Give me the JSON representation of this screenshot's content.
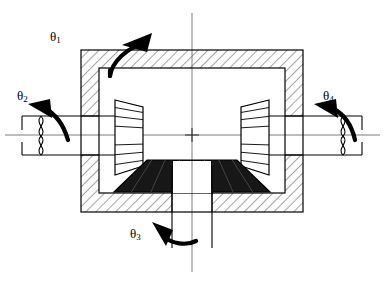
{
  "figure": {
    "type": "engineering-cross-section-diagram",
    "background_color": "#ffffff",
    "line_color": "#000000",
    "hatch_color": "#555555",
    "centerline_color": "#777777",
    "gear_fill_dark": "#171717"
  },
  "labels": {
    "theta1": {
      "symbol": "θ",
      "subscript": "1",
      "name": "housing-rotation"
    },
    "theta2": {
      "symbol": "θ",
      "subscript": "2",
      "name": "left-shaft-rotation"
    },
    "theta3": {
      "symbol": "θ",
      "subscript": "3",
      "name": "bottom-shaft-rotation"
    },
    "theta4": {
      "symbol": "θ",
      "subscript": "4",
      "name": "right-shaft-rotation"
    }
  },
  "components": {
    "housing": "hatched carrier housing",
    "left_bevel_gear": "left side bevel gear",
    "right_bevel_gear": "right side bevel gear",
    "bottom_bevel_gear": "bottom pinion bevel gear",
    "left_shaft": "left output shaft with break symbol",
    "right_shaft": "right output shaft with break symbol",
    "bottom_shaft": "bottom input shaft",
    "vertical_centerline": "vertical axis of symmetry",
    "horizontal_centerline": "horizontal shaft axis"
  }
}
